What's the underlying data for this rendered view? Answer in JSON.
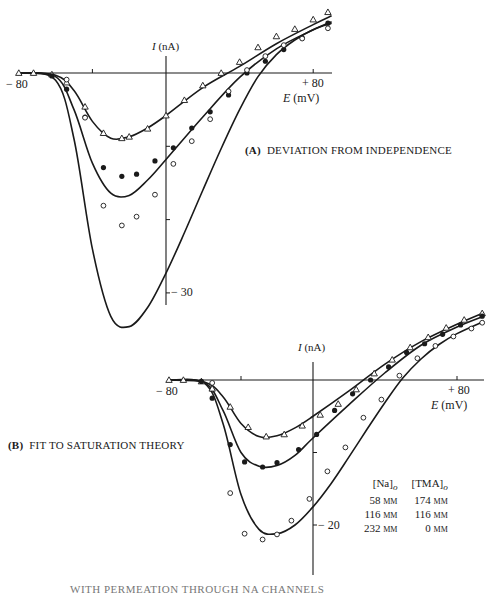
{
  "chart_data": [
    {
      "type": "scatter",
      "panel": "A",
      "title": "(A) DEVIATION FROM INDEPENDENCE",
      "xlabel": "E (mV)",
      "ylabel": "I (nA)",
      "x_tick_labels": [
        "-80",
        "+80"
      ],
      "y_tick_labels": [
        "-30"
      ],
      "xlim": [
        -80,
        90
      ],
      "ylim": [
        -37,
        9
      ],
      "grid": false,
      "series": [
        {
          "name": "58 mM Na / 174 mM TMA",
          "marker": "triangle-open",
          "x": [
            -80,
            -72,
            -62,
            -54,
            -44,
            -34,
            -24,
            -20,
            -10,
            0,
            10,
            20,
            30,
            40,
            50,
            60,
            70,
            80,
            88
          ],
          "y": [
            0,
            0,
            -0.2,
            -1.3,
            -4.6,
            -8.2,
            -8.9,
            -8.7,
            -7.6,
            -5.8,
            -3.7,
            -1.7,
            0,
            1.5,
            3.5,
            5.0,
            6.0,
            7.3,
            8.3
          ]
        },
        {
          "name": "116 mM Na / 116 mM TMA",
          "marker": "filled-circle",
          "x": [
            -62,
            -54,
            -44,
            -34,
            -24,
            -16,
            -6,
            4,
            14,
            24,
            34,
            44,
            54,
            64,
            74,
            88
          ],
          "y": [
            -0.4,
            -2.2,
            -6.0,
            -12.9,
            -14.1,
            -13.8,
            -12.0,
            -10.2,
            -7.5,
            -5.3,
            -3.0,
            0,
            1.6,
            3.2,
            4.8,
            6.8
          ]
        },
        {
          "name": "232 mM Na / 0 mM TMA",
          "marker": "open-circle",
          "x": [
            -54,
            -44,
            -34,
            -24,
            -16,
            -6,
            4,
            14,
            24,
            34,
            44,
            54,
            64,
            74,
            88
          ],
          "y": [
            -0.9,
            -6.1,
            -18.1,
            -20.8,
            -19.6,
            -16.6,
            -12.4,
            -9.3,
            -6.3,
            -2.5,
            0.4,
            2.3,
            3.8,
            4.7,
            6.1
          ]
        }
      ],
      "fits": [
        {
          "name": "independence fit 58 mM",
          "x": [
            -80,
            -60,
            -50,
            -40,
            -30,
            -20,
            -10,
            0,
            20,
            40,
            60,
            80,
            90
          ],
          "y": [
            0,
            -0.3,
            -2.4,
            -6.6,
            -8.9,
            -8.7,
            -7.5,
            -5.8,
            -2.0,
            0.9,
            4.0,
            6.6,
            7.8
          ]
        },
        {
          "name": "independence fit 116 mM",
          "x": [
            -80,
            -60,
            -50,
            -40,
            -30,
            -20,
            -10,
            0,
            20,
            40,
            60,
            80,
            90
          ],
          "y": [
            0,
            -0.5,
            -5.0,
            -12.3,
            -16.4,
            -16.7,
            -14.6,
            -11.8,
            -6.0,
            -0.6,
            3.3,
            5.9,
            7.0
          ]
        },
        {
          "name": "independence fit 232 mM",
          "x": [
            -80,
            -60,
            -50,
            -40,
            -30,
            -20,
            -10,
            0,
            10,
            20,
            30,
            40,
            50,
            60,
            70,
            80,
            90
          ],
          "y": [
            0,
            -1.0,
            -9.0,
            -24.0,
            -33.2,
            -34.6,
            -32.0,
            -27.3,
            -21.8,
            -16.0,
            -10.3,
            -5.0,
            -0.5,
            2.5,
            4.5,
            5.9,
            6.8
          ]
        }
      ]
    },
    {
      "type": "scatter",
      "panel": "B",
      "title": "(B) FIT TO SATURATION THEORY",
      "xlabel": "E (mV)",
      "ylabel": "I (nA)",
      "x_tick_labels": [
        "-80",
        "+80"
      ],
      "y_tick_labels": [
        "-20"
      ],
      "xlim": [
        -80,
        95
      ],
      "ylim": [
        -25,
        9
      ],
      "grid": false,
      "series": [
        {
          "name": "58 mM Na / 174 mM TMA",
          "marker": "triangle-open",
          "x": [
            -80,
            -72,
            -62,
            -56,
            -46,
            -36,
            -26,
            -16,
            -6,
            4,
            14,
            24,
            34,
            44,
            54,
            64,
            74,
            84,
            94
          ],
          "y": [
            0,
            0,
            -0.2,
            -1.2,
            -3.7,
            -6.5,
            -7.8,
            -7.5,
            -6.3,
            -4.8,
            -3.3,
            -1.3,
            0.9,
            2.8,
            4.5,
            5.9,
            7.2,
            8.3,
            9.2
          ]
        },
        {
          "name": "116 mM Na / 116 mM TMA",
          "marker": "filled-circle",
          "x": [
            -62,
            -56,
            -46,
            -38,
            -28,
            -20,
            -8,
            2,
            12,
            22,
            32,
            42,
            52,
            62,
            72,
            82,
            94
          ],
          "y": [
            -0.2,
            -2.5,
            -8.9,
            -11.3,
            -12.0,
            -11.4,
            -9.6,
            -7.5,
            -4.2,
            -1.9,
            0,
            1.8,
            3.8,
            5.0,
            6.3,
            7.6,
            8.8
          ]
        },
        {
          "name": "232 mM Na / 0 mM TMA",
          "marker": "open-circle",
          "x": [
            -56,
            -46,
            -38,
            -28,
            -20,
            -12,
            -2,
            8,
            18,
            28,
            38,
            48,
            58,
            68,
            78,
            88,
            94
          ],
          "y": [
            -0.4,
            -15.6,
            -21.2,
            -22.0,
            -21.3,
            -19.4,
            -16.4,
            -12.6,
            -9.3,
            -5.2,
            -2.7,
            0.6,
            3.0,
            4.7,
            6.0,
            7.1,
            7.9
          ]
        }
      ],
      "fits": [
        {
          "name": "saturation fit 58 mM",
          "x": [
            -80,
            -60,
            -50,
            -40,
            -30,
            -20,
            -10,
            0,
            20,
            40,
            60,
            80,
            95
          ],
          "y": [
            0,
            -0.3,
            -2.3,
            -6.0,
            -7.8,
            -7.7,
            -6.6,
            -5.0,
            -1.5,
            2.2,
            5.3,
            7.7,
            9.3
          ]
        },
        {
          "name": "saturation fit 116 mM",
          "x": [
            -80,
            -60,
            -50,
            -40,
            -30,
            -20,
            -10,
            0,
            20,
            40,
            60,
            80,
            95
          ],
          "y": [
            0,
            -0.4,
            -4.2,
            -10.0,
            -11.9,
            -11.8,
            -10.4,
            -8.0,
            -3.4,
            1.0,
            4.8,
            7.3,
            8.8
          ]
        },
        {
          "name": "saturation fit 232 mM",
          "x": [
            -80,
            -60,
            -50,
            -40,
            -30,
            -20,
            -10,
            0,
            10,
            20,
            30,
            40,
            50,
            60,
            70,
            80,
            95
          ],
          "y": [
            0,
            -0.5,
            -6.0,
            -15.8,
            -20.6,
            -21.2,
            -20.0,
            -17.5,
            -14.3,
            -10.6,
            -6.8,
            -3.1,
            0.3,
            2.9,
            4.9,
            6.4,
            8.1
          ]
        }
      ],
      "legend": {
        "headers": [
          "[Na]o",
          "[TMA]o"
        ],
        "rows": [
          [
            "58 mM",
            "174 mM"
          ],
          [
            "116 mM",
            "116 mM"
          ],
          [
            "232 mM",
            "0 mM"
          ]
        ],
        "position": "right-center"
      }
    }
  ],
  "panelA": {
    "title_letter": "(A)",
    "title_text": "DEVIATION FROM INDEPENDENCE",
    "y_axis_label_i": "I",
    "y_axis_label_unit": " (nA)",
    "x_axis_label_e": "E",
    "x_axis_label_unit": " (mV)",
    "x_min_label": "− 80",
    "x_max_label": "+ 80",
    "y_tick_label": "− 30"
  },
  "panelB": {
    "title_letter": "(B)",
    "title_text": "FIT TO SATURATION THEORY",
    "y_axis_label_i": "I",
    "y_axis_label_unit": " (nA)",
    "x_axis_label_e": "E",
    "x_axis_label_unit": " (mV)",
    "x_min_label": "− 80",
    "x_max_label": "+ 80",
    "y_tick_label": "− 20",
    "legend": {
      "h1_main": "[Na]",
      "h1_sub": "o",
      "h2_main": "[TMA]",
      "h2_sub": "o",
      "r1c1_num": "58 ",
      "r1c1_unit": "mm",
      "r1c2_num": "174 ",
      "r1c2_unit": "mm",
      "r2c1_num": "116 ",
      "r2c1_unit": "mm",
      "r2c2_num": "116 ",
      "r2c2_unit": "mm",
      "r3c1_num": "232 ",
      "r3c1_unit": "mm",
      "r3c2_num": "0 ",
      "r3c2_unit": "mm"
    }
  },
  "caption_fragment": "WITH PERMEATION THROUGH NA CHANNELS"
}
